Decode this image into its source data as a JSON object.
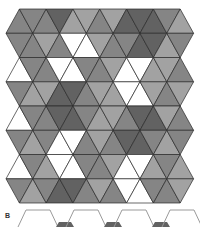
{
  "figure": {
    "panel_b_label": "B",
    "colors": {
      "w": "#ffffff",
      "l": "#a2a2a2",
      "m": "#858585",
      "d": "#626262",
      "line": "#2a2a2a",
      "outline": "#9a9a9a"
    },
    "geometry": {
      "origin_x": 6,
      "origin_y": 9,
      "side": 14.47,
      "row_height": 24.25
    },
    "tiling_rows": [
      [
        "m",
        "m",
        "m",
        "d",
        "l",
        "l",
        "m",
        "l",
        "d",
        "d",
        "d",
        "m",
        "l"
      ],
      [
        "m",
        "m",
        "l",
        "m",
        "w",
        "w",
        "l",
        "m",
        "m",
        "d",
        "d",
        "l",
        "m"
      ],
      [
        "w",
        "m",
        "m",
        "w",
        "w",
        "m",
        "m",
        "l",
        "w",
        "w",
        "l",
        "l",
        "m"
      ],
      [
        "m",
        "l",
        "l",
        "d",
        "d",
        "m",
        "l",
        "l",
        "w",
        "w",
        "l",
        "m",
        "l"
      ],
      [
        "w",
        "m",
        "m",
        "d",
        "d",
        "m",
        "l",
        "l",
        "m",
        "d",
        "d",
        "l",
        "m"
      ],
      [
        "m",
        "l",
        "m",
        "w",
        "w",
        "m",
        "l",
        "m",
        "d",
        "d",
        "m",
        "l",
        "m"
      ],
      [
        "w",
        "m",
        "l",
        "w",
        "w",
        "m",
        "m",
        "l",
        "w",
        "w",
        "l",
        "m",
        "l"
      ],
      [
        "m",
        "l",
        "m",
        "d",
        "d",
        "m",
        "l",
        "m",
        "w",
        "w",
        "m",
        "m",
        "l"
      ]
    ],
    "panel_b_shapes": [
      {
        "x": 16,
        "filled": false
      },
      {
        "x": 64,
        "filled": true
      },
      {
        "x": 112,
        "filled": true
      },
      {
        "x": 160,
        "filled": true
      }
    ]
  }
}
